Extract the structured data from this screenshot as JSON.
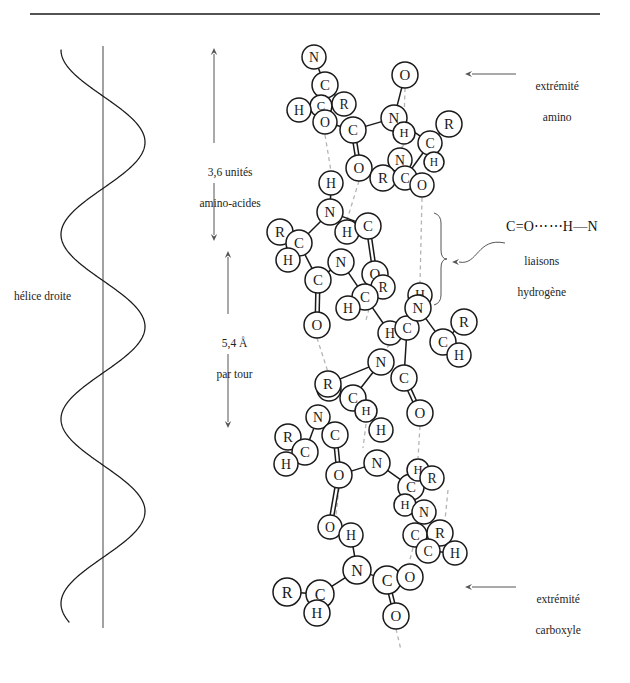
{
  "figure": {
    "title": "",
    "background": "#ffffff",
    "ink": "#1a1a1a",
    "hbond_color": "#b4b4b4"
  },
  "top_rule": {
    "name": "horizontal-rule",
    "x1": 30,
    "x2": 600,
    "y": 14
  },
  "helix": {
    "label": "hélice droite",
    "label_x": 14,
    "label_y": 289,
    "axis_x": 103,
    "axis_top": 46,
    "axis_bottom": 628,
    "amplitude": 42,
    "turns": 3.1,
    "description": "right-handed coil drawn around a vertical axis"
  },
  "measures": [
    {
      "name": "residues-per-turn",
      "text_line1": "3,6 unités",
      "text_line2": "amino-acides",
      "x": 214,
      "y_top": 48,
      "y_bottom": 241,
      "text_x": 188,
      "text_y": 149,
      "arrow_both_ends": true
    },
    {
      "name": "rise-per-turn",
      "text_line1": "5,4 Å",
      "text_line2": "par tour",
      "x": 228,
      "y_top": 251,
      "y_bottom": 428,
      "text_x": 205,
      "text_y": 320,
      "arrow_both_ends": true
    }
  ],
  "callouts": [
    {
      "name": "amino-terminus",
      "line1": "extrémité",
      "line2": "amino",
      "text_x": 524,
      "text_y": 63,
      "arrow_from_x": 516,
      "arrow_to_x": 465,
      "arrow_y": 74
    },
    {
      "name": "carboxyl-terminus",
      "line1": "extrémité",
      "line2": "carboxyle",
      "text_x": 524,
      "text_y": 576,
      "arrow_from_x": 516,
      "arrow_to_x": 465,
      "arrow_y": 587
    }
  ],
  "hydrogen_bond_callout": {
    "name": "hydrogen-bond-legend",
    "formula": "C=O⋯⋯H—N",
    "line1": "liaisons",
    "line2": "hydrogène",
    "formula_x": 506,
    "formula_y": 218,
    "text_x": 546,
    "text_y": 238,
    "brace_x": 441,
    "brace_top": 213,
    "brace_bottom": 305,
    "leader_start_x": 505,
    "leader_start_y": 243,
    "leader_end_x": 452,
    "leader_end_y": 262
  },
  "molecule": {
    "name": "alpha-helix-backbone",
    "atom_radius": 12.5,
    "legend_atoms": [
      "N",
      "C",
      "H",
      "O",
      "R"
    ],
    "atoms": [
      {
        "id": "n1",
        "label": "N",
        "x": 314,
        "y": 57,
        "r": 12
      },
      {
        "id": "c1",
        "label": "C",
        "x": 325,
        "y": 85,
        "r": 13
      },
      {
        "id": "c1a",
        "label": "C",
        "x": 321,
        "y": 106,
        "r": 11
      },
      {
        "id": "r1",
        "label": "R",
        "x": 344,
        "y": 104,
        "r": 12
      },
      {
        "id": "h1",
        "label": "H",
        "x": 299,
        "y": 110,
        "r": 12
      },
      {
        "id": "o1",
        "label": "O",
        "x": 325,
        "y": 122,
        "r": 12
      },
      {
        "id": "o2",
        "label": "O",
        "x": 405,
        "y": 75,
        "r": 13
      },
      {
        "id": "c2",
        "label": "C",
        "x": 353,
        "y": 130,
        "r": 13
      },
      {
        "id": "n2",
        "label": "N",
        "x": 394,
        "y": 118,
        "r": 13
      },
      {
        "id": "r2",
        "label": "R",
        "x": 449,
        "y": 124,
        "r": 13
      },
      {
        "id": "h2",
        "label": "H",
        "x": 404,
        "y": 133,
        "r": 11
      },
      {
        "id": "c3",
        "label": "C",
        "x": 430,
        "y": 143,
        "r": 12
      },
      {
        "id": "h3",
        "label": "H",
        "x": 434,
        "y": 162,
        "r": 10
      },
      {
        "id": "o3",
        "label": "O",
        "x": 359,
        "y": 168,
        "r": 13
      },
      {
        "id": "n3",
        "label": "N",
        "x": 400,
        "y": 160,
        "r": 12
      },
      {
        "id": "r3",
        "label": "R",
        "x": 383,
        "y": 178,
        "r": 13
      },
      {
        "id": "c4",
        "label": "C",
        "x": 405,
        "y": 178,
        "r": 12
      },
      {
        "id": "h4",
        "label": "H",
        "x": 331,
        "y": 183,
        "r": 12
      },
      {
        "id": "o4",
        "label": "O",
        "x": 422,
        "y": 185,
        "r": 12
      },
      {
        "id": "n4",
        "label": "N",
        "x": 330,
        "y": 212,
        "r": 13
      },
      {
        "id": "r4",
        "label": "R",
        "x": 280,
        "y": 232,
        "r": 13
      },
      {
        "id": "c5",
        "label": "C",
        "x": 299,
        "y": 243,
        "r": 13
      },
      {
        "id": "h5",
        "label": "H",
        "x": 288,
        "y": 260,
        "r": 12
      },
      {
        "id": "h6",
        "label": "H",
        "x": 347,
        "y": 232,
        "r": 12
      },
      {
        "id": "c6",
        "label": "C",
        "x": 368,
        "y": 226,
        "r": 13
      },
      {
        "id": "n5",
        "label": "N",
        "x": 341,
        "y": 262,
        "r": 13
      },
      {
        "id": "c7",
        "label": "C",
        "x": 318,
        "y": 280,
        "r": 13
      },
      {
        "id": "o5",
        "label": "O",
        "x": 375,
        "y": 274,
        "r": 13
      },
      {
        "id": "r5",
        "label": "R",
        "x": 383,
        "y": 287,
        "r": 12
      },
      {
        "id": "c8",
        "label": "C",
        "x": 365,
        "y": 297,
        "r": 13
      },
      {
        "id": "h7",
        "label": "H",
        "x": 348,
        "y": 308,
        "r": 12
      },
      {
        "id": "o6",
        "label": "O",
        "x": 317,
        "y": 325,
        "r": 13
      },
      {
        "id": "h8",
        "label": "H",
        "x": 420,
        "y": 295,
        "r": 12
      },
      {
        "id": "h9",
        "label": "H",
        "x": 390,
        "y": 333,
        "r": 12
      },
      {
        "id": "c9",
        "label": "C",
        "x": 407,
        "y": 328,
        "r": 12
      },
      {
        "id": "n6",
        "label": "N",
        "x": 418,
        "y": 308,
        "r": 13
      },
      {
        "id": "r6",
        "label": "R",
        "x": 464,
        "y": 322,
        "r": 13
      },
      {
        "id": "c10",
        "label": "C",
        "x": 443,
        "y": 342,
        "r": 13
      },
      {
        "id": "h10",
        "label": "H",
        "x": 459,
        "y": 355,
        "r": 12
      },
      {
        "id": "n7",
        "label": "N",
        "x": 381,
        "y": 362,
        "r": 13
      },
      {
        "id": "c11",
        "label": "C",
        "x": 404,
        "y": 378,
        "r": 13
      },
      {
        "id": "o7",
        "label": "O",
        "x": 420,
        "y": 413,
        "r": 13
      },
      {
        "id": "h11",
        "label": "H",
        "x": 329,
        "y": 389,
        "r": 12
      },
      {
        "id": "r7",
        "label": "R",
        "x": 328,
        "y": 384,
        "r": 13
      },
      {
        "id": "c12",
        "label": "C",
        "x": 353,
        "y": 398,
        "r": 13
      },
      {
        "id": "h12",
        "label": "H",
        "x": 366,
        "y": 411,
        "r": 11
      },
      {
        "id": "n8",
        "label": "N",
        "x": 318,
        "y": 417,
        "r": 12
      },
      {
        "id": "c13",
        "label": "C",
        "x": 335,
        "y": 435,
        "r": 13
      },
      {
        "id": "r8",
        "label": "R",
        "x": 288,
        "y": 437,
        "r": 13
      },
      {
        "id": "c14",
        "label": "C",
        "x": 305,
        "y": 452,
        "r": 13
      },
      {
        "id": "h13",
        "label": "H",
        "x": 286,
        "y": 464,
        "r": 12
      },
      {
        "id": "h14",
        "label": "H",
        "x": 381,
        "y": 430,
        "r": 12
      },
      {
        "id": "n9",
        "label": "N",
        "x": 377,
        "y": 463,
        "r": 13
      },
      {
        "id": "o8",
        "label": "O",
        "x": 339,
        "y": 475,
        "r": 13
      },
      {
        "id": "c15",
        "label": "C",
        "x": 411,
        "y": 487,
        "r": 13
      },
      {
        "id": "h15",
        "label": "H",
        "x": 418,
        "y": 470,
        "r": 11
      },
      {
        "id": "r9",
        "label": "R",
        "x": 432,
        "y": 478,
        "r": 12
      },
      {
        "id": "h16",
        "label": "H",
        "x": 405,
        "y": 505,
        "r": 11
      },
      {
        "id": "n10",
        "label": "N",
        "x": 424,
        "y": 512,
        "r": 12
      },
      {
        "id": "o9",
        "label": "O",
        "x": 330,
        "y": 527,
        "r": 12
      },
      {
        "id": "h17",
        "label": "H",
        "x": 351,
        "y": 535,
        "r": 12
      },
      {
        "id": "c16",
        "label": "C",
        "x": 415,
        "y": 535,
        "r": 12
      },
      {
        "id": "r10",
        "label": "R",
        "x": 440,
        "y": 533,
        "r": 13
      },
      {
        "id": "c17",
        "label": "C",
        "x": 428,
        "y": 551,
        "r": 12
      },
      {
        "id": "h18",
        "label": "H",
        "x": 455,
        "y": 553,
        "r": 12
      },
      {
        "id": "n11",
        "label": "N",
        "x": 357,
        "y": 570,
        "r": 14
      },
      {
        "id": "c18",
        "label": "C",
        "x": 387,
        "y": 580,
        "r": 14
      },
      {
        "id": "o10",
        "label": "O",
        "x": 410,
        "y": 577,
        "r": 13
      },
      {
        "id": "r11",
        "label": "R",
        "x": 287,
        "y": 592,
        "r": 14
      },
      {
        "id": "c19",
        "label": "C",
        "x": 320,
        "y": 594,
        "r": 14
      },
      {
        "id": "h19",
        "label": "H",
        "x": 317,
        "y": 613,
        "r": 13
      },
      {
        "id": "o11",
        "label": "O",
        "x": 396,
        "y": 616,
        "r": 13
      }
    ],
    "bonds": [
      {
        "a": "n1",
        "b": "c1",
        "type": "single"
      },
      {
        "a": "c1",
        "b": "r1",
        "type": "single"
      },
      {
        "a": "c1",
        "b": "c1a",
        "type": "single"
      },
      {
        "a": "c1a",
        "b": "h1",
        "type": "single"
      },
      {
        "a": "c1a",
        "b": "o1",
        "type": "double"
      },
      {
        "a": "o1",
        "b": "c2",
        "type": "single"
      },
      {
        "a": "c2",
        "b": "n2",
        "type": "single"
      },
      {
        "a": "c2",
        "b": "o3",
        "type": "double"
      },
      {
        "a": "n2",
        "b": "o2",
        "type": "single"
      },
      {
        "a": "n2",
        "b": "h2",
        "type": "single"
      },
      {
        "a": "n2",
        "b": "c3",
        "type": "single"
      },
      {
        "a": "c3",
        "b": "r2",
        "type": "single"
      },
      {
        "a": "c3",
        "b": "h3",
        "type": "single"
      },
      {
        "a": "c3",
        "b": "c4",
        "type": "single"
      },
      {
        "a": "c4",
        "b": "o4",
        "type": "double"
      },
      {
        "a": "c4",
        "b": "n3",
        "type": "single"
      },
      {
        "a": "n3",
        "b": "r3",
        "type": "single"
      },
      {
        "a": "h4",
        "b": "n4",
        "type": "single"
      },
      {
        "a": "n4",
        "b": "c5",
        "type": "single"
      },
      {
        "a": "n4",
        "b": "h6",
        "type": "single"
      },
      {
        "a": "n4",
        "b": "c6",
        "type": "single"
      },
      {
        "a": "c5",
        "b": "r4",
        "type": "single"
      },
      {
        "a": "c5",
        "b": "h5",
        "type": "single"
      },
      {
        "a": "c5",
        "b": "c7",
        "type": "single"
      },
      {
        "a": "c6",
        "b": "o5",
        "type": "double"
      },
      {
        "a": "c7",
        "b": "n5",
        "type": "single"
      },
      {
        "a": "c7",
        "b": "o6",
        "type": "double"
      },
      {
        "a": "n5",
        "b": "c8",
        "type": "single"
      },
      {
        "a": "c8",
        "b": "r5",
        "type": "single"
      },
      {
        "a": "c8",
        "b": "h7",
        "type": "single"
      },
      {
        "a": "c8",
        "b": "h9",
        "type": "single"
      },
      {
        "a": "n6",
        "b": "c9",
        "type": "single"
      },
      {
        "a": "n6",
        "b": "h8",
        "type": "single"
      },
      {
        "a": "n6",
        "b": "c10",
        "type": "single"
      },
      {
        "a": "c10",
        "b": "r6",
        "type": "single"
      },
      {
        "a": "c10",
        "b": "h10",
        "type": "single"
      },
      {
        "a": "c9",
        "b": "c11",
        "type": "single"
      },
      {
        "a": "c11",
        "b": "o7",
        "type": "double"
      },
      {
        "a": "n7",
        "b": "c12",
        "type": "single"
      },
      {
        "a": "n7",
        "b": "r7",
        "type": "single"
      },
      {
        "a": "c12",
        "b": "h12",
        "type": "single"
      },
      {
        "a": "n8",
        "b": "c13",
        "type": "single"
      },
      {
        "a": "n8",
        "b": "c14",
        "type": "single"
      },
      {
        "a": "c14",
        "b": "r8",
        "type": "single"
      },
      {
        "a": "c14",
        "b": "h13",
        "type": "single"
      },
      {
        "a": "c13",
        "b": "o8",
        "type": "double"
      },
      {
        "a": "o8",
        "b": "n9",
        "type": "single"
      },
      {
        "a": "o8",
        "b": "o9",
        "type": "double"
      },
      {
        "a": "n9",
        "b": "c15",
        "type": "single"
      },
      {
        "a": "c15",
        "b": "r9",
        "type": "single"
      },
      {
        "a": "c15",
        "b": "h16",
        "type": "single"
      },
      {
        "a": "n10",
        "b": "c16",
        "type": "single"
      },
      {
        "a": "c16",
        "b": "c17",
        "type": "double"
      },
      {
        "a": "c17",
        "b": "h18",
        "type": "single"
      },
      {
        "a": "c17",
        "b": "r10",
        "type": "single"
      },
      {
        "a": "h17",
        "b": "n11",
        "type": "single"
      },
      {
        "a": "n11",
        "b": "c18",
        "type": "single"
      },
      {
        "a": "n11",
        "b": "c19",
        "type": "single"
      },
      {
        "a": "c19",
        "b": "r11",
        "type": "single"
      },
      {
        "a": "c19",
        "b": "h19",
        "type": "single"
      },
      {
        "a": "c18",
        "b": "o10",
        "type": "single"
      },
      {
        "a": "c18",
        "b": "o11",
        "type": "double"
      }
    ],
    "hydrogen_bonds": [
      {
        "x1": 325,
        "y1": 135,
        "x2": 331,
        "y2": 171
      },
      {
        "x1": 331,
        "y1": 196,
        "x2": 330,
        "y2": 200
      },
      {
        "x1": 405,
        "y1": 88,
        "x2": 404,
        "y2": 122
      },
      {
        "x1": 404,
        "y1": 145,
        "x2": 400,
        "y2": 149
      },
      {
        "x1": 359,
        "y1": 181,
        "x2": 347,
        "y2": 220
      },
      {
        "x1": 422,
        "y1": 198,
        "x2": 420,
        "y2": 283
      },
      {
        "x1": 375,
        "y1": 287,
        "x2": 366,
        "y2": 320
      },
      {
        "x1": 317,
        "y1": 338,
        "x2": 328,
        "y2": 372
      },
      {
        "x1": 420,
        "y1": 426,
        "x2": 418,
        "y2": 458
      },
      {
        "x1": 390,
        "y1": 345,
        "x2": 384,
        "y2": 350
      },
      {
        "x1": 366,
        "y1": 424,
        "x2": 363,
        "y2": 448
      },
      {
        "x1": 339,
        "y1": 488,
        "x2": 336,
        "y2": 515
      },
      {
        "x1": 330,
        "y1": 540,
        "x2": 348,
        "y2": 523
      },
      {
        "x1": 448,
        "y1": 490,
        "x2": 444,
        "y2": 530
      },
      {
        "x1": 396,
        "y1": 629,
        "x2": 401,
        "y2": 650
      },
      {
        "x1": 413,
        "y1": 548,
        "x2": 409,
        "y2": 563
      }
    ]
  }
}
